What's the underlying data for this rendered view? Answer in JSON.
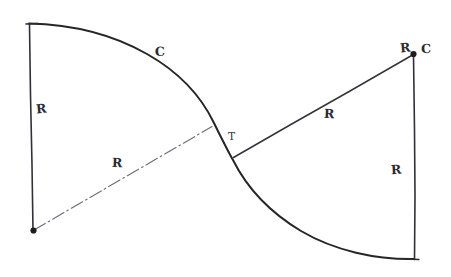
{
  "figure": {
    "kind": "hand-drawn-engineering-sketch",
    "background_color": "#ffffff",
    "ink_color": "#2b2b2f",
    "centerline_color": "#6e6e78"
  },
  "labels": {
    "left_radius_vertical": "R",
    "left_arc_designation": "C",
    "lower_left_radius_diagonal": "R",
    "tangent_point": "T",
    "upper_right_radius_diagonal": "R",
    "right_center_radius": "R",
    "right_arc_designation": "C",
    "right_radius_vertical": "R"
  },
  "geometry": {
    "left_center": {
      "name": "C1",
      "x": 33,
      "y": 231
    },
    "right_center": {
      "name": "C2",
      "x": 414,
      "y": 54
    },
    "tangent_point": {
      "name": "T",
      "x": 223,
      "y": 142
    },
    "left_arc": {
      "start_x": 29,
      "start_y": 24,
      "end_x": 223,
      "end_y": 142,
      "radius": 206,
      "sweep": "clockwise"
    },
    "right_arc": {
      "start_x": 223,
      "start_y": 142,
      "end_x": 414,
      "end_y": 259,
      "radius": 205,
      "sweep": "counter-clockwise"
    },
    "left_vertical": {
      "x1": 29,
      "y1": 24,
      "x2": 33,
      "y2": 231
    },
    "right_vertical": {
      "x1": 414,
      "y1": 54,
      "x2": 415,
      "y2": 259
    },
    "left_center_to_tangent": {
      "x1": 33,
      "y1": 231,
      "x2": 212,
      "y2": 126
    },
    "tangent_to_right_center": {
      "x1": 233,
      "y1": 157,
      "x2": 414,
      "y2": 54
    }
  },
  "label_positions": {
    "left_radius_vertical": {
      "x": 36,
      "y": 101
    },
    "left_arc_designation": {
      "x": 155,
      "y": 44
    },
    "lower_left_radius_diagonal": {
      "x": 112,
      "y": 155
    },
    "tangent_point": {
      "x": 228,
      "y": 130
    },
    "upper_right_radius_diagonal": {
      "x": 324,
      "y": 106
    },
    "right_center_radius": {
      "x": 400,
      "y": 40
    },
    "right_arc_designation": {
      "x": 421,
      "y": 41
    },
    "right_radius_vertical": {
      "x": 391,
      "y": 162
    }
  }
}
